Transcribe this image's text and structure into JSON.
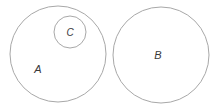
{
  "diagram": {
    "type": "euler-diagram",
    "canvas": {
      "width": 221,
      "height": 112,
      "background": "#ffffff"
    },
    "style": {
      "stroke_color": "#a8a8a8",
      "stroke_width": 1,
      "fill": "none",
      "label_color": "#3a3a3a",
      "label_style": "italic"
    },
    "sets": [
      {
        "id": "A",
        "label": "A",
        "cx": 58,
        "cy": 54,
        "r": 48,
        "label_x": 38,
        "label_y": 70,
        "relation": "contains C, disjoint from B"
      },
      {
        "id": "C",
        "label": "C",
        "cx": 70,
        "cy": 32,
        "r": 16,
        "label_x": 70,
        "label_y": 33,
        "relation": "proper subset of A"
      },
      {
        "id": "B",
        "label": "B",
        "cx": 161,
        "cy": 55,
        "r": 48,
        "label_x": 158,
        "label_y": 56,
        "relation": "disjoint from A and C"
      }
    ]
  }
}
